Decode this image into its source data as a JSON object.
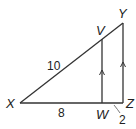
{
  "diagram": {
    "type": "similar-triangles",
    "stroke_color": "#333333",
    "vertices": {
      "X": {
        "label": "X",
        "x": 20,
        "y": 103
      },
      "W": {
        "label": "W",
        "x": 102,
        "y": 103
      },
      "Z": {
        "label": "Z",
        "x": 123,
        "y": 103
      },
      "Y": {
        "label": "Y",
        "x": 123,
        "y": 23
      },
      "V": {
        "label": "V",
        "x": 102,
        "y": 39
      }
    },
    "segments": [
      {
        "from": "X",
        "to": "Y"
      },
      {
        "from": "X",
        "to": "Z"
      },
      {
        "from": "Y",
        "to": "Z",
        "parallel_mark": true
      },
      {
        "from": "V",
        "to": "W",
        "parallel_mark": true
      }
    ],
    "measurements": {
      "XV": "10",
      "XW": "8",
      "WZ": "2"
    }
  }
}
